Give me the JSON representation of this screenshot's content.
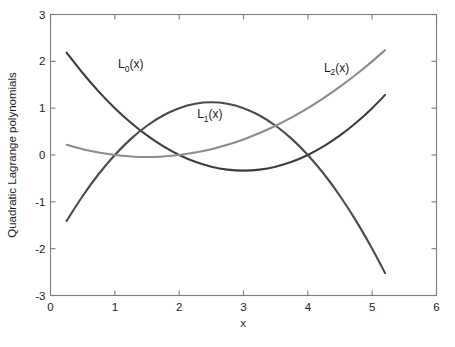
{
  "figure": {
    "background_color": "#ffffff",
    "axis_color": "#7d7d7d"
  },
  "chart_data": {
    "type": "line",
    "title": "",
    "subtitle": "",
    "xlabel": "x",
    "ylabel": "Quadratic Lagrange polynomials",
    "xlim": [
      0,
      6
    ],
    "ylim": [
      -3,
      3
    ],
    "xticks": [
      0,
      1,
      2,
      3,
      4,
      5,
      6
    ],
    "xtick_labels": [
      "0",
      "1",
      "2",
      "3",
      "4",
      "5",
      "6"
    ],
    "yticks": [
      -3,
      -2,
      -1,
      0,
      1,
      2,
      3
    ],
    "ytick_labels": [
      "-3",
      "-2",
      "-1",
      "0",
      "1",
      "2",
      "3"
    ],
    "grid": false,
    "legend_position": "inline-annotations",
    "x_domain_plotted": [
      0.25,
      5.2
    ],
    "interpolation_nodes": [
      1,
      2,
      4
    ],
    "series": [
      {
        "name": "L_0(x)",
        "label_text": "L",
        "label_sub": "0",
        "label_tail": "(x)",
        "color": "#3d3d3d",
        "formula": "(x-2)(x-4)/3",
        "annotation_x": 1.05,
        "annotation_y": 1.85,
        "x": [
          0.25,
          0.5,
          0.75,
          1.0,
          1.25,
          1.5,
          1.75,
          2.0,
          2.25,
          2.5,
          2.75,
          3.0,
          3.25,
          3.5,
          3.75,
          4.0,
          4.25,
          4.5,
          4.75,
          5.0,
          5.2
        ],
        "y": [
          2.188,
          1.75,
          1.354,
          1.0,
          0.688,
          0.417,
          0.188,
          0.0,
          -0.146,
          -0.25,
          -0.313,
          -0.333,
          -0.313,
          -0.25,
          -0.146,
          0.0,
          0.188,
          0.417,
          0.688,
          1.0,
          1.28
        ]
      },
      {
        "name": "L_1(x)",
        "label_text": "L",
        "label_sub": "1",
        "label_tail": "(x)",
        "color": "#4a4a4a",
        "formula": "-(x-1)(x-4)/2",
        "annotation_x": 2.28,
        "annotation_y": 0.78,
        "x": [
          0.25,
          0.5,
          0.75,
          1.0,
          1.25,
          1.5,
          1.75,
          2.0,
          2.25,
          2.5,
          2.75,
          3.0,
          3.25,
          3.5,
          3.75,
          4.0,
          4.25,
          4.5,
          4.75,
          5.0,
          5.2
        ],
        "y": [
          -1.406,
          -0.875,
          -0.406,
          0.0,
          0.344,
          0.625,
          0.844,
          1.0,
          1.094,
          1.125,
          1.094,
          1.0,
          0.844,
          0.625,
          0.344,
          0.0,
          -0.406,
          -0.875,
          -1.406,
          -2.0,
          -2.52
        ]
      },
      {
        "name": "L_2(x)",
        "label_text": "L",
        "label_sub": "2",
        "label_tail": "(x)",
        "color": "#8c8c8c",
        "formula": "(x-1)(x-2)/6",
        "annotation_x": 4.25,
        "annotation_y": 1.78,
        "x": [
          0.25,
          0.5,
          0.75,
          1.0,
          1.25,
          1.5,
          1.75,
          2.0,
          2.25,
          2.5,
          2.75,
          3.0,
          3.25,
          3.5,
          3.75,
          4.0,
          4.25,
          4.5,
          4.75,
          5.0,
          5.2
        ],
        "y": [
          0.219,
          0.125,
          0.052,
          0.0,
          -0.031,
          -0.042,
          -0.031,
          0.0,
          0.052,
          0.125,
          0.219,
          0.333,
          0.469,
          0.625,
          0.802,
          1.0,
          1.219,
          1.458,
          1.719,
          2.0,
          2.24
        ]
      }
    ]
  }
}
